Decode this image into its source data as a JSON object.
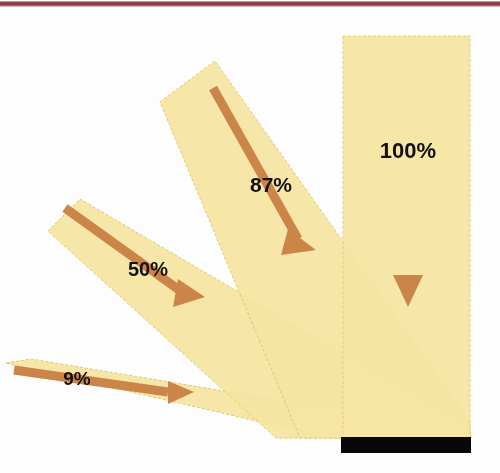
{
  "figure": {
    "type": "diagram",
    "canvas": {
      "width": 500,
      "height": 473
    },
    "background_color": "#fdfdfd",
    "top_rule_color": "#7d3340"
  },
  "surface": {
    "name": "absorbing-surface",
    "color": "#080808",
    "x": 341,
    "y": 437,
    "width": 130,
    "height": 16
  },
  "convergence_point": {
    "x": 470,
    "y": 438
  },
  "palette": {
    "beam_fill": "#f7e7a4",
    "beam_fill_overlap": "#f8d84e",
    "beam_edge": "#e8c96a",
    "arrow": "#cc8549",
    "label_text": "#141010",
    "surface": "#080808",
    "top_rule": "#7d3340"
  },
  "chart_data": {
    "type": "diagram",
    "xlabel": "",
    "ylabel": "",
    "categories": [
      "9%",
      "50%",
      "87%",
      "100%"
    ],
    "values": [
      9,
      50,
      87,
      100
    ],
    "unit": "%",
    "annotations": [
      "9%",
      "50%",
      "87%",
      "100%"
    ],
    "legend": []
  },
  "beams": [
    {
      "id": "beam-9",
      "label": "9%",
      "value": 9,
      "angle_deg": 10,
      "label_x": 77,
      "label_y": 385,
      "label_font_size": 19,
      "beam_polygon": "6,363 31,359 470,432 470,438 330,438",
      "shaft": {
        "x1": 14,
        "y1": 370,
        "x2": 168,
        "y2": 392
      },
      "arrow_head": "168,381 194,392 168,404"
    },
    {
      "id": "beam-50",
      "label": "50%",
      "value": 50,
      "angle_deg": 38,
      "label_x": 132,
      "label_y": 276,
      "label_font_size": 20,
      "beam_polygon": "48,231 80,199 470,428 470,438 276,438",
      "shaft": {
        "x1": 65,
        "y1": 208,
        "x2": 182,
        "y2": 292
      },
      "arrow_head": "178,279 205,297 173,307"
    },
    {
      "id": "beam-87",
      "label": "87%",
      "value": 87,
      "angle_deg": 63,
      "label_x": 248,
      "label_y": 192,
      "label_font_size": 21,
      "beam_polygon": "160,102 215,61 470,421 470,438 300,438",
      "shaft": {
        "x1": 213,
        "y1": 88,
        "x2": 298,
        "y2": 239
      },
      "arrow_head": "288,229 316,250 281,255"
    },
    {
      "id": "beam-100",
      "label": "100%",
      "value": 100,
      "angle_deg": 90,
      "label_x": 408,
      "label_y": 158,
      "label_font_size": 22,
      "beam_polygon": "343,36 470,36 470,438 343,438",
      "shaft": {
        "x1": 408,
        "y1": 41,
        "x2": 408,
        "y2": 280
      },
      "arrow_head": "393,275 423,275 408,307"
    }
  ]
}
